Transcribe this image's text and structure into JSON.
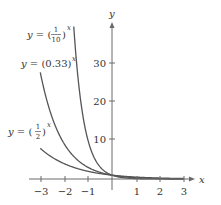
{
  "chart_data": {
    "type": "line",
    "title": "",
    "xlabel": "x",
    "ylabel": "y",
    "xlim": [
      -3,
      3
    ],
    "ylim": [
      0,
      40
    ],
    "x_ticks": [
      "−3",
      "−2",
      "−1",
      "1",
      "2",
      "3"
    ],
    "y_ticks": [
      "10",
      "20",
      "30"
    ],
    "grid": false,
    "legend": "inline labels",
    "series": [
      {
        "name": "y = (1/10)^x",
        "base": 0.1,
        "label_parts": {
          "lhs": "y = ",
          "num": "1",
          "den": "10",
          "exp": "x"
        },
        "x": [
          -1.6,
          -1.5,
          -1,
          -0.5,
          0,
          1,
          2,
          3
        ],
        "values": [
          39.8,
          31.6,
          10,
          3.16,
          1,
          0.1,
          0.01,
          0.001
        ]
      },
      {
        "name": "y = (0.33)^x",
        "base": 0.33,
        "label_parts": {
          "lhs": "y = ",
          "mid": "(0.33)",
          "exp": "x"
        },
        "x": [
          -3,
          -2,
          -1,
          0,
          1,
          2,
          3
        ],
        "values": [
          27.8,
          9.18,
          3.03,
          1,
          0.33,
          0.109,
          0.036
        ]
      },
      {
        "name": "y = (1/2)^x",
        "base": 0.5,
        "label_parts": {
          "lhs": "y = ",
          "num": "1",
          "den": "2",
          "exp": "x"
        },
        "x": [
          -3,
          -2,
          -1,
          0,
          1,
          2,
          3
        ],
        "values": [
          8,
          4,
          2,
          1,
          0.5,
          0.25,
          0.125
        ]
      }
    ]
  },
  "labels": {
    "x_axis": "x",
    "y_axis": "y",
    "eq_lhs": "y = ",
    "eq1_num": "1",
    "eq1_den": "10",
    "eq2_mid": "(0.33)",
    "eq3_num": "1",
    "eq3_den": "2",
    "exp": "x",
    "xt_m3": "−3",
    "xt_m2": "−2",
    "xt_m1": "−1",
    "xt_1": "1",
    "xt_2": "2",
    "xt_3": "3",
    "yt_10": "10",
    "yt_20": "20",
    "yt_30": "30"
  }
}
